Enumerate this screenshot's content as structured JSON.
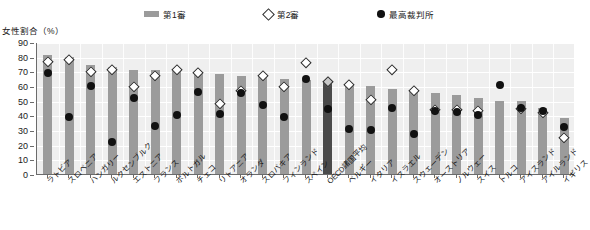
{
  "legend": {
    "items": [
      {
        "label": "第1審",
        "icon": "bar-swatch",
        "color": "#9b9b9b"
      },
      {
        "label": "第2審",
        "icon": "diamond-marker",
        "color": "#ffffff"
      },
      {
        "label": "最高裁判所",
        "icon": "circle-marker",
        "color": "#111111"
      }
    ]
  },
  "axis": {
    "y_title": "女性割合（%）",
    "y_ticks": [
      "90",
      "80",
      "70",
      "60",
      "50",
      "40",
      "30",
      "20",
      "10",
      "0"
    ]
  },
  "colors": {
    "bar": "#9b9b9b",
    "bar_highlight": "#4a4a4a",
    "diamond_edge": "#2b2b2b",
    "dot": "#111111",
    "plot_bg": "#efefef",
    "grid": "#ffffff",
    "axis": "#6b6b6b"
  },
  "chart_data": {
    "type": "bar",
    "title": "",
    "subtitle": "",
    "xlabel": "",
    "ylabel": "女性割合（%）",
    "ylim": [
      0,
      90
    ],
    "ytick_step": 10,
    "grid": true,
    "legend_position": "top",
    "categories": [
      "ラトビア",
      "スロベニア",
      "ハンガリー",
      "ルクセンブルク",
      "エストニア",
      "フランス",
      "ポルトガル",
      "チェコ",
      "リトアニア",
      "オランダ",
      "スロバキア",
      "フィンランド",
      "スペイン",
      "OECD諸国平均",
      "ベルギー",
      "イタリア",
      "イスラエル",
      "スウェーデン",
      "オーストリア",
      "ノルウェー",
      "スイス",
      "トルコ",
      "アイスランド",
      "アイルランド",
      "イギリス"
    ],
    "highlight_category": "OECD諸国平均",
    "series": [
      {
        "name": "第1審",
        "type": "bar",
        "values": [
          81,
          80,
          74,
          73,
          71,
          71,
          70,
          68,
          68,
          67,
          66,
          65,
          64,
          63,
          61,
          60,
          58,
          57,
          55,
          54,
          52,
          50,
          50,
          45,
          38
        ]
      },
      {
        "name": "第2審",
        "type": "diamond",
        "values": [
          77,
          78,
          70,
          71,
          60,
          67,
          71,
          69,
          48,
          57,
          67,
          60,
          76,
          63,
          61,
          51,
          71,
          57,
          44,
          44,
          43,
          null,
          45,
          42,
          25
        ]
      },
      {
        "name": "最高裁判所",
        "type": "circle",
        "values": [
          69,
          39,
          60,
          22,
          52,
          33,
          40,
          56,
          41,
          55,
          47,
          39,
          65,
          44,
          31,
          30,
          45,
          27,
          43,
          42,
          40,
          61,
          45,
          43,
          32
        ]
      }
    ]
  }
}
